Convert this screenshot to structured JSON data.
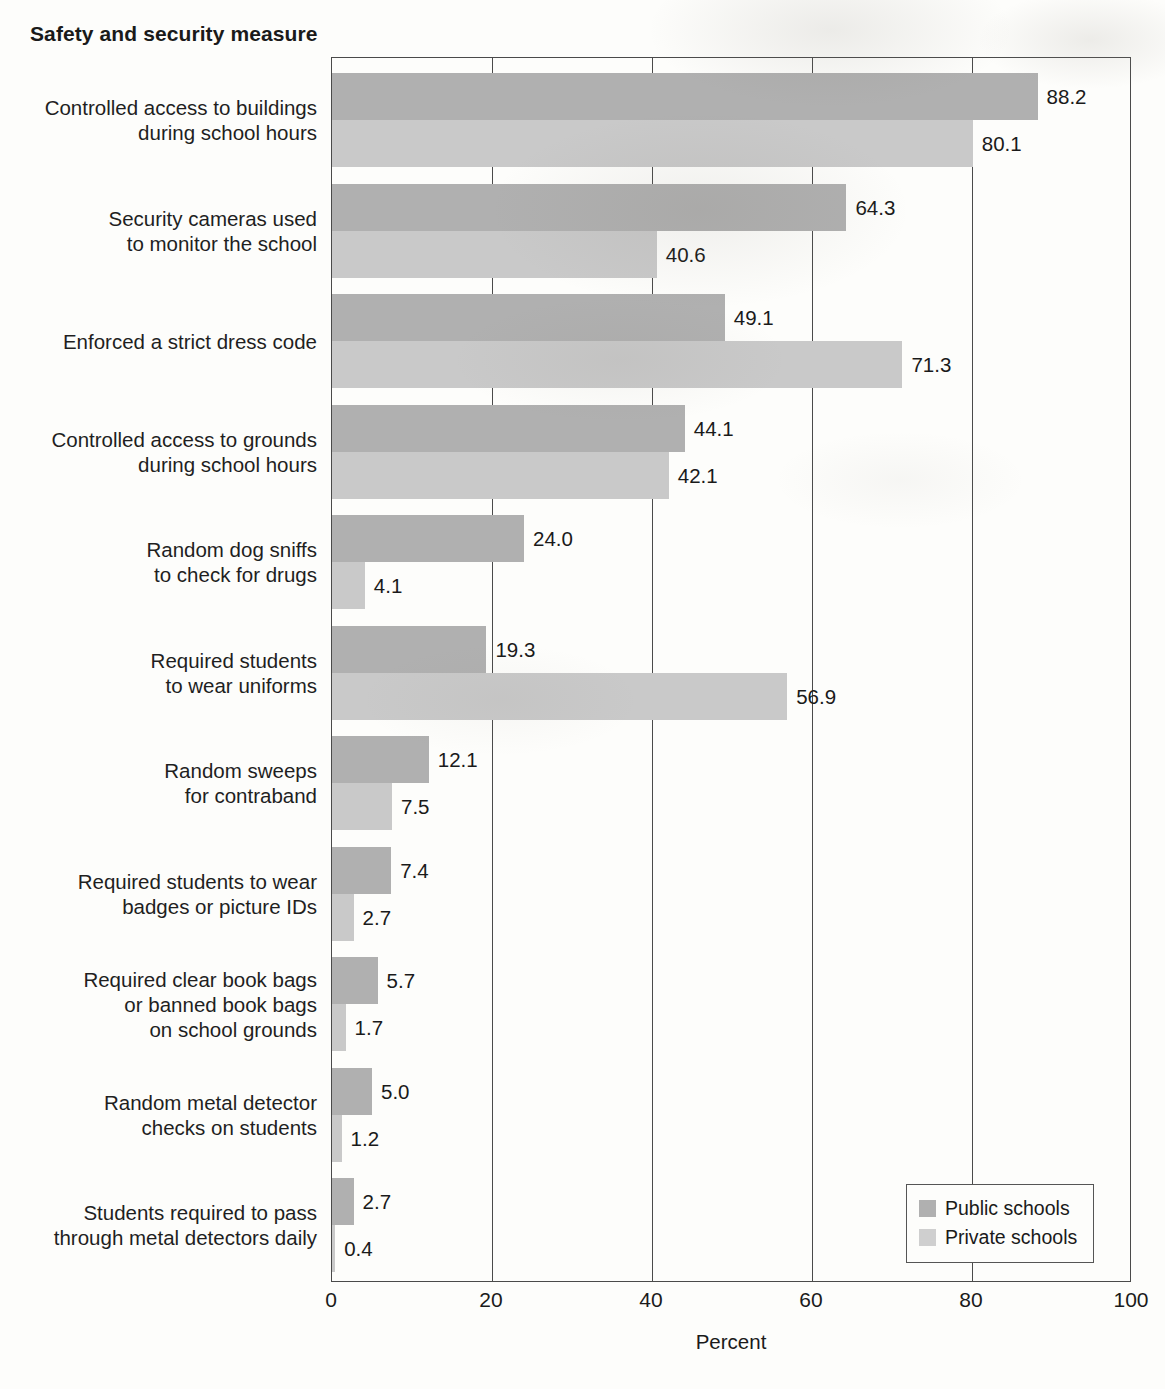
{
  "chart": {
    "title": "Safety and security measure",
    "xlabel": "Percent"
  },
  "legend": {
    "items": [
      {
        "label": "Public schools",
        "color": "#b0b0b0",
        "swatch": "public"
      },
      {
        "label": "Private schools",
        "color": "#cfcfcf",
        "swatch": "private"
      }
    ]
  },
  "axis": {
    "ticks": [
      "0",
      "20",
      "40",
      "60",
      "80",
      "100"
    ]
  },
  "chart_data": {
    "type": "bar",
    "orientation": "horizontal",
    "title": "Safety and security measure",
    "xlabel": "Percent",
    "ylabel": "Safety and security measure",
    "xlim": [
      0,
      100
    ],
    "xticks": [
      0,
      20,
      40,
      60,
      80,
      100
    ],
    "grid": true,
    "legend_position": "bottom-right",
    "categories": [
      "Controlled access to buildings\nduring school hours",
      "Security cameras used\nto monitor the school",
      "Enforced a strict dress code",
      "Controlled access to grounds\nduring school hours",
      "Random dog sniffs\nto check for drugs",
      "Required students\nto wear uniforms",
      "Random sweeps\nfor contraband",
      "Required students to wear\nbadges or picture IDs",
      "Required clear book bags\nor banned book bags\non school grounds",
      "Random metal detector\nchecks on students",
      "Students required to pass\nthrough metal detectors daily"
    ],
    "series": [
      {
        "name": "Public schools",
        "color": "#b0b0b0",
        "values": [
          88.2,
          64.3,
          49.1,
          44.1,
          24.0,
          19.3,
          12.1,
          7.4,
          5.7,
          5.0,
          2.7
        ],
        "labels": [
          "88.2",
          "64.3",
          "49.1",
          "44.1",
          "24.0",
          "19.3",
          "12.1",
          "7.4",
          "5.7",
          "5.0",
          "2.7"
        ]
      },
      {
        "name": "Private schools",
        "color": "#c9c9c9",
        "values": [
          80.1,
          40.6,
          71.3,
          42.1,
          4.1,
          56.9,
          7.5,
          2.7,
          1.7,
          1.2,
          0.4
        ],
        "labels": [
          "80.1",
          "40.6",
          "71.3",
          "42.1",
          "4.1",
          "56.9",
          "7.5",
          "2.7",
          "1.7",
          "1.2",
          "0.4"
        ]
      }
    ]
  }
}
